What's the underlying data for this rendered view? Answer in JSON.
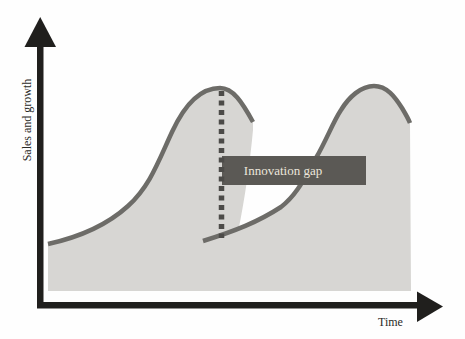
{
  "figure": {
    "y_axis_label": "Sales and growth",
    "x_axis_label": "Time",
    "gap_label": "Innovation gap"
  },
  "colors": {
    "background": "#fefefe",
    "curve_fill": "#d7d6d3",
    "curve_outline": "#6d6c68",
    "gap_box": "#5b5955",
    "gap_box_text": "#ece6db",
    "dashed_line": "#4c4b48",
    "axis": "#201f1d"
  }
}
